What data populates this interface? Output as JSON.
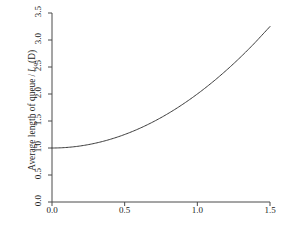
{
  "chart_data": {
    "type": "line",
    "title": "",
    "xlabel": "Coefficient of variation of service time, v",
    "xlabel_text": "Coefficient of variation of service time,",
    "xlabel_symbol": "v",
    "ylabel": "Average length of queue / Lq(D)",
    "ylabel_prefix": "Average length of queue",
    "ylabel_divider": "/",
    "ylabel_symbol": "L",
    "ylabel_subscript": "q",
    "ylabel_arg": "(D)",
    "xlim": [
      0.0,
      1.5
    ],
    "ylim": [
      0.0,
      3.5
    ],
    "xticks": [
      "0.0",
      "0.5",
      "1.0",
      "1.5"
    ],
    "xtick_values": [
      0.0,
      0.5,
      1.0,
      1.5
    ],
    "yticks": [
      "0.0",
      "0.5",
      "1.0",
      "1.5",
      "2.0",
      "2.5",
      "3.0",
      "3.5"
    ],
    "ytick_values": [
      0.0,
      0.5,
      1.0,
      1.5,
      2.0,
      2.5,
      3.0,
      3.5
    ],
    "grid": false,
    "legend": null,
    "line_color": "#3a3a3a",
    "axis_color": "#4a4a4a",
    "series": [
      {
        "name": "Lq / Lq(D)",
        "formula": "1 + v^2",
        "x": [
          0.0,
          0.1,
          0.2,
          0.3,
          0.4,
          0.5,
          0.6,
          0.7,
          0.8,
          0.9,
          1.0,
          1.1,
          1.2,
          1.3,
          1.4,
          1.5
        ],
        "values": [
          1.0,
          1.01,
          1.04,
          1.09,
          1.16,
          1.25,
          1.36,
          1.49,
          1.64,
          1.81,
          2.0,
          2.21,
          2.44,
          2.69,
          2.96,
          3.25
        ]
      }
    ]
  }
}
